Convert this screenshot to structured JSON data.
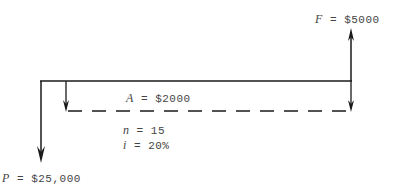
{
  "diagram": {
    "type": "cash-flow-diagram",
    "future_value": {
      "symbol": "F",
      "eq": "=",
      "value": "$5000"
    },
    "annuity": {
      "symbol": "A",
      "eq": "=",
      "value": "$2000"
    },
    "periods": {
      "symbol": "n",
      "eq": "=",
      "value": "15"
    },
    "interest": {
      "symbol": "i",
      "eq": "=",
      "value": "20%"
    },
    "present_value": {
      "symbol": "P",
      "eq": "=",
      "value": "$25,000"
    },
    "line_color": "#1a1a1a"
  }
}
